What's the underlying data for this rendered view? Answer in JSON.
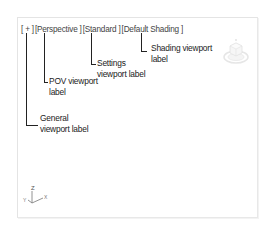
{
  "viewport": {
    "labels": {
      "general": "[ + ]",
      "pov": "[Perspective ]",
      "settings": "[Standard ]",
      "shading": "[Default Shading ]"
    },
    "callouts": {
      "general": [
        "General",
        "viewport label"
      ],
      "pov": [
        "POV viewport",
        "label"
      ],
      "settings": [
        "Settings",
        "viewport label"
      ],
      "shading": [
        "Shading viewport",
        "label"
      ]
    },
    "axis_tripod": {
      "z": "Z",
      "y": "Y",
      "x": "X"
    },
    "icons": {
      "steering": "viewcube-compass-icon",
      "axis": "axis-tripod-icon"
    }
  }
}
